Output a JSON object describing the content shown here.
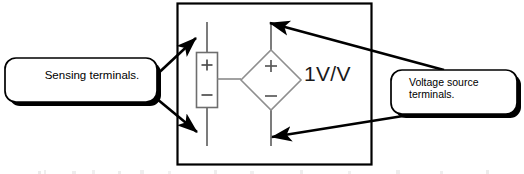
{
  "figure": {
    "type": "schematic-diagram",
    "background_color": "#ffffff",
    "width": 524,
    "height": 174
  },
  "diagram": {
    "outer_box": {
      "name": "component-boundary",
      "stroke_color": "#000000"
    },
    "gain_label": "1V/V",
    "sensing_element": {
      "name": "sensing-port",
      "plus_sign": "+",
      "minus_sign": "−",
      "stroke_color": "#666666"
    },
    "dependent_source": {
      "name": "dependent-voltage-source",
      "shape": "diamond",
      "plus_sign": "+",
      "minus_sign": "−",
      "stroke_color": "#808080"
    }
  },
  "callouts": [
    {
      "id": "sensing",
      "label": "Sensing terminals.",
      "fill_color": "#ffffff",
      "border_color": "#000000",
      "shadow_color": "#000000",
      "arrow_count": 2
    },
    {
      "id": "voltage-source",
      "label": "Voltage source\nterminals.",
      "fill_color": "#ffffff",
      "border_color": "#000000",
      "shadow_color": "#000000",
      "arrow_count": 2
    }
  ],
  "arrows": {
    "name": "annotation-arrows",
    "color": "#000000",
    "targets": [
      "sensing-terminal-top",
      "sensing-terminal-bottom",
      "source-terminal-top",
      "source-terminal-bottom"
    ]
  }
}
